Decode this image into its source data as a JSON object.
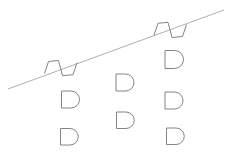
{
  "canvas": {
    "width": 229,
    "height": 161,
    "background_color": "#ffffff"
  },
  "diagram": {
    "stroke_color": "#848484",
    "stroke_width": 1,
    "line": {
      "name": "diagonal-line",
      "x1": 8,
      "y1": 89,
      "x2": 224,
      "y2": 10,
      "color": "#9a9a9a",
      "width": 0.8
    },
    "notched_shapes": [
      {
        "name": "notched-shape-upper-right",
        "points": [
          [
            154,
            35.3
          ],
          [
            158,
            23.3
          ],
          [
            168,
            22.3
          ],
          [
            172,
            37.5
          ],
          [
            182.5,
            36.5
          ],
          [
            186.5,
            24.5
          ]
        ]
      },
      {
        "name": "notched-shape-lower-left",
        "points": [
          [
            44.5,
            73.5
          ],
          [
            48.5,
            61.5
          ],
          [
            58.5,
            60.5
          ],
          [
            62.5,
            75.7
          ],
          [
            73,
            74.7
          ],
          [
            77,
            62.7
          ]
        ]
      }
    ],
    "door_shapes": [
      {
        "name": "door-shape-col3-row1",
        "x": 165,
        "y": 50.5,
        "flat_width": 9.5,
        "height": 18
      },
      {
        "name": "door-shape-col2-row1",
        "x": 116,
        "y": 74,
        "flat_width": 9.5,
        "height": 17
      },
      {
        "name": "door-shape-col1-row1",
        "x": 61.5,
        "y": 91,
        "flat_width": 9.5,
        "height": 17
      },
      {
        "name": "door-shape-col3-row2",
        "x": 165,
        "y": 92,
        "flat_width": 9.5,
        "height": 17
      },
      {
        "name": "door-shape-col2-row2",
        "x": 116.5,
        "y": 112,
        "flat_width": 9.5,
        "height": 16.5
      },
      {
        "name": "door-shape-col1-row2",
        "x": 60.5,
        "y": 128.5,
        "flat_width": 9.5,
        "height": 16.5
      },
      {
        "name": "door-shape-col3-row3",
        "x": 166.5,
        "y": 128,
        "flat_width": 9.5,
        "height": 16.5
      }
    ]
  }
}
